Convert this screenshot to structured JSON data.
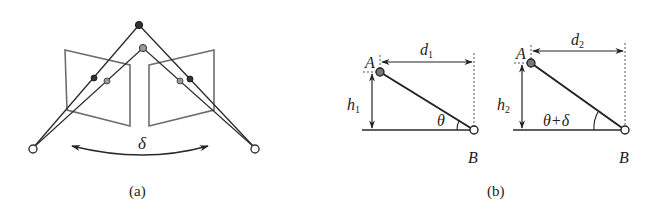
{
  "figure": {
    "panel_a": {
      "caption": "(a)",
      "angle_label": "δ",
      "elements": [
        "left-camera-plane",
        "right-camera-plane",
        "point-dark-top",
        "point-gray-top",
        "camera-center-left",
        "camera-center-right",
        "rotation-arrow"
      ]
    },
    "panel_b": {
      "caption": "(b)",
      "left": {
        "point_a": "A",
        "point_b": "B",
        "distance": "d",
        "distance_sub": "1",
        "height": "h",
        "height_sub": "1",
        "angle": "θ"
      },
      "right": {
        "point_a": "A",
        "point_b": "B",
        "distance": "d",
        "distance_sub": "2",
        "height": "h",
        "height_sub": "2",
        "angle": "θ+δ"
      }
    }
  },
  "colors": {
    "line": "#2a2a2a",
    "plane": "#6e6e6e",
    "dark_point": "#333333",
    "gray_point": "#888888",
    "open_point": "#ffffff"
  }
}
